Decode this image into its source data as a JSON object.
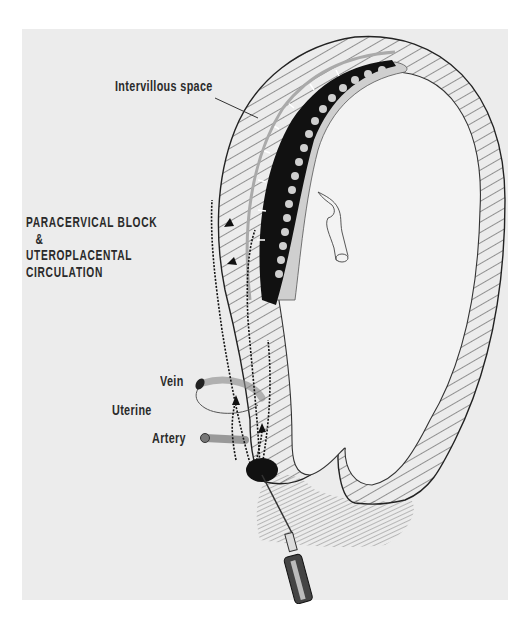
{
  "figure": {
    "title_lines": [
      "PARACERVICAL BLOCK",
      "&",
      "UTEROPLACENTAL",
      "CIRCULATION"
    ],
    "labels": {
      "intervillous_space": "Intervillous space",
      "vein": "Vein",
      "uterine": "Uterine",
      "artery": "Artery"
    },
    "colors": {
      "background": "#ffffff",
      "panel": "#ececec",
      "ink": "#1a1a1a",
      "placenta": "#111111",
      "vessel": "#9a9a9a"
    }
  }
}
